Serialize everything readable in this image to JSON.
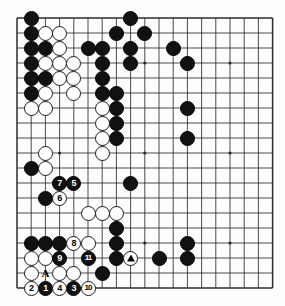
{
  "figure": {
    "kind": "go-board-diagram",
    "board_size": 19,
    "visible_columns": 19,
    "visible_rows": 19,
    "grid_color": "#2b2b2b",
    "black_color": "#111111",
    "white_color": "#ffffff",
    "background_color": "#fdfdfd"
  },
  "geometry": {
    "origin_x": 17,
    "origin_y": 18,
    "step_x": 14.2,
    "step_y": 15.0,
    "stone_diameter": 15.0
  },
  "star_points": [
    {
      "col": 4,
      "row": 4
    },
    {
      "col": 10,
      "row": 4
    },
    {
      "col": 16,
      "row": 4
    },
    {
      "col": 4,
      "row": 10
    },
    {
      "col": 10,
      "row": 10
    },
    {
      "col": 16,
      "row": 10
    },
    {
      "col": 4,
      "row": 16
    },
    {
      "col": 10,
      "row": 16
    },
    {
      "col": 16,
      "row": 16
    }
  ],
  "stones": {
    "black": [
      {
        "col": 2,
        "row": 1
      },
      {
        "col": 9,
        "row": 1
      },
      {
        "col": 2,
        "row": 2
      },
      {
        "col": 8,
        "row": 2
      },
      {
        "col": 10,
        "row": 2
      },
      {
        "col": 2,
        "row": 3
      },
      {
        "col": 3,
        "row": 3
      },
      {
        "col": 6,
        "row": 3
      },
      {
        "col": 7,
        "row": 3
      },
      {
        "col": 9,
        "row": 3
      },
      {
        "col": 12,
        "row": 3
      },
      {
        "col": 2,
        "row": 4
      },
      {
        "col": 7,
        "row": 4
      },
      {
        "col": 9,
        "row": 4
      },
      {
        "col": 13,
        "row": 4
      },
      {
        "col": 2,
        "row": 5
      },
      {
        "col": 3,
        "row": 5
      },
      {
        "col": 7,
        "row": 5
      },
      {
        "col": 2,
        "row": 6
      },
      {
        "col": 7,
        "row": 6
      },
      {
        "col": 8,
        "row": 6
      },
      {
        "col": 8,
        "row": 7
      },
      {
        "col": 13,
        "row": 7
      },
      {
        "col": 8,
        "row": 8
      },
      {
        "col": 8,
        "row": 9
      },
      {
        "col": 13,
        "row": 9
      },
      {
        "col": 2,
        "row": 11
      },
      {
        "col": 3,
        "row": 13
      },
      {
        "col": 9,
        "row": 12
      },
      {
        "col": 8,
        "row": 15
      },
      {
        "col": 2,
        "row": 16
      },
      {
        "col": 3,
        "row": 16
      },
      {
        "col": 4,
        "row": 16
      },
      {
        "col": 8,
        "row": 16
      },
      {
        "col": 13,
        "row": 16
      },
      {
        "col": 8,
        "row": 17
      },
      {
        "col": 11,
        "row": 17
      },
      {
        "col": 13,
        "row": 17
      },
      {
        "col": 7,
        "row": 18
      }
    ],
    "white": [
      {
        "col": 3,
        "row": 2
      },
      {
        "col": 4,
        "row": 2
      },
      {
        "col": 4,
        "row": 3
      },
      {
        "col": 3,
        "row": 4
      },
      {
        "col": 4,
        "row": 4
      },
      {
        "col": 5,
        "row": 4
      },
      {
        "col": 4,
        "row": 5
      },
      {
        "col": 5,
        "row": 5
      },
      {
        "col": 3,
        "row": 6
      },
      {
        "col": 5,
        "row": 6
      },
      {
        "col": 2,
        "row": 7
      },
      {
        "col": 3,
        "row": 7
      },
      {
        "col": 7,
        "row": 7
      },
      {
        "col": 7,
        "row": 8
      },
      {
        "col": 7,
        "row": 9
      },
      {
        "col": 3,
        "row": 10
      },
      {
        "col": 7,
        "row": 10
      },
      {
        "col": 3,
        "row": 11
      },
      {
        "col": 6,
        "row": 14
      },
      {
        "col": 7,
        "row": 14
      },
      {
        "col": 8,
        "row": 14
      },
      {
        "col": 6,
        "row": 16
      },
      {
        "col": 2,
        "row": 17
      },
      {
        "col": 3,
        "row": 17
      },
      {
        "col": 2,
        "row": 18
      },
      {
        "col": 4,
        "row": 18
      },
      {
        "col": 5,
        "row": 18
      }
    ]
  },
  "move_stones": [
    {
      "label": "1",
      "color": "black",
      "col": 3,
      "row": 19
    },
    {
      "label": "2",
      "color": "white",
      "col": 2,
      "row": 19
    },
    {
      "label": "3",
      "color": "black",
      "col": 5,
      "row": 19
    },
    {
      "label": "4",
      "color": "white",
      "col": 4,
      "row": 19
    },
    {
      "label": "5",
      "color": "black",
      "col": 5,
      "row": 12
    },
    {
      "label": "6",
      "color": "white",
      "col": 4,
      "row": 13
    },
    {
      "label": "7",
      "color": "black",
      "col": 4,
      "row": 12
    },
    {
      "label": "8",
      "color": "white",
      "col": 5,
      "row": 16
    },
    {
      "label": "9",
      "color": "black",
      "col": 4,
      "row": 17
    },
    {
      "label": "10",
      "color": "white",
      "col": 6,
      "row": 19
    },
    {
      "label": "11",
      "color": "black",
      "col": 6,
      "row": 17
    }
  ],
  "marked_stones": [
    {
      "marker": "triangle",
      "color": "white",
      "col": 9,
      "row": 17
    }
  ],
  "point_labels": [
    {
      "text": "A",
      "col": 3,
      "row": 18
    }
  ]
}
